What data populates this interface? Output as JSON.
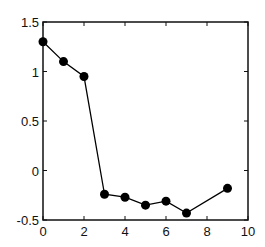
{
  "chart_data": {
    "type": "line",
    "title": "",
    "xlabel": "",
    "ylabel": "",
    "x": [
      0,
      1,
      2,
      3,
      4,
      5,
      6,
      7,
      9
    ],
    "series": [
      {
        "name": "series-1",
        "values": [
          1.3,
          1.1,
          0.95,
          -0.24,
          -0.27,
          -0.35,
          -0.31,
          -0.43,
          -0.18
        ],
        "marker": "filled-circle",
        "color": "#000000"
      }
    ],
    "xlim": [
      0,
      10
    ],
    "ylim": [
      -0.5,
      1.5
    ],
    "xticks": [
      0,
      2,
      4,
      6,
      8,
      10
    ],
    "yticks": [
      -0.5,
      0,
      0.5,
      1,
      1.5
    ],
    "xtick_labels": [
      "0",
      "2",
      "4",
      "6",
      "8",
      "10"
    ],
    "ytick_labels": [
      "-0.5",
      "0",
      "0.5",
      "1",
      "1.5"
    ],
    "grid": false,
    "legend": null
  }
}
